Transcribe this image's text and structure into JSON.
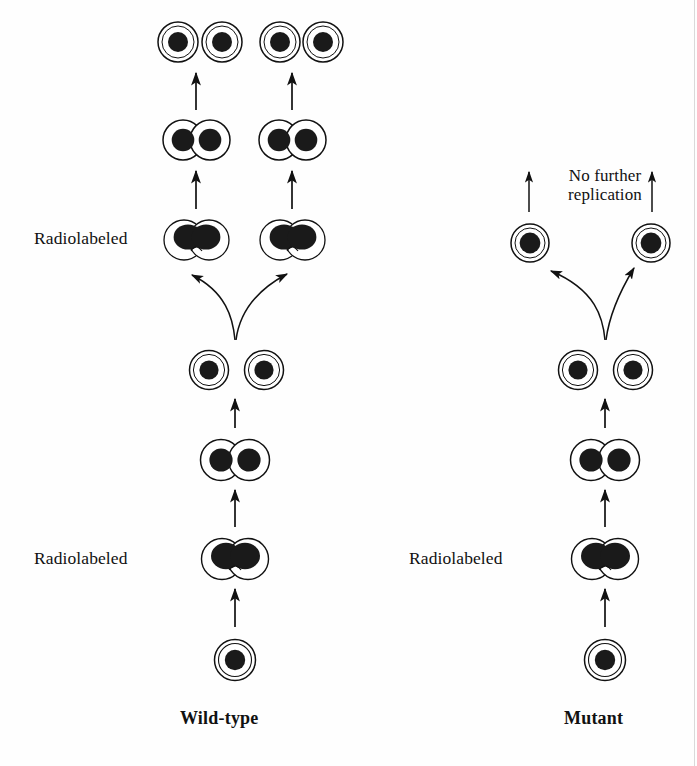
{
  "figure": {
    "background_color": "#ffffff",
    "ink_color": "#111111",
    "nucleus_color": "#1a1a1a",
    "width": 697,
    "height": 766
  },
  "labels": {
    "wild_type": "Wild-type",
    "mutant": "Mutant",
    "radiolabeled_left_bottom": "Radiolabeled",
    "radiolabeled_left_upper": "Radiolabeled",
    "radiolabeled_right_bottom": "Radiolabeled",
    "no_further_replication": "No further replication"
  },
  "columns": [
    {
      "id": "wild-type",
      "label": "Wild-type",
      "center_x": 235,
      "label_y": 719,
      "generations": [
        {
          "id": "wt-gen0",
          "row": 0,
          "y": 660,
          "cell_type": "single",
          "radiolabeled": false,
          "cells": [
            {
              "x": 235,
              "nuclei": 1
            }
          ],
          "description": "Single unlabeled founder cell"
        },
        {
          "id": "wt-gen1",
          "row": 1,
          "y": 559,
          "cell_type": "dividing-fused",
          "radiolabeled": true,
          "label": "Radiolabeled",
          "cells": [
            {
              "x": 235,
              "nuclei": 2
            }
          ],
          "description": "Radiolabeled dividing cell with fused dark nucleoids"
        },
        {
          "id": "wt-gen2",
          "row": 2,
          "y": 460,
          "cell_type": "dividing-pair",
          "radiolabeled": false,
          "cells": [
            {
              "x": 235,
              "nuclei": 2
            }
          ],
          "description": "Dividing cell, two separated nuclei"
        },
        {
          "id": "wt-gen3",
          "row": 3,
          "y": 370,
          "cell_type": "two-singles",
          "radiolabeled": false,
          "cells": [
            {
              "x": 209,
              "nuclei": 1
            },
            {
              "x": 264,
              "nuclei": 1
            }
          ],
          "description": "Two separate daughter cells"
        },
        {
          "id": "wt-gen4",
          "row": 4,
          "y": 240,
          "cell_type": "dividing-fused",
          "radiolabeled": true,
          "label": "Radiolabeled",
          "cells": [
            {
              "x": 196,
              "nuclei": 2
            },
            {
              "x": 292,
              "nuclei": 2
            }
          ],
          "description": "Two radiolabeled dividing cells produced by branching"
        },
        {
          "id": "wt-gen5",
          "row": 5,
          "y": 140,
          "cell_type": "dividing-pair",
          "radiolabeled": false,
          "cells": [
            {
              "x": 196,
              "nuclei": 2
            },
            {
              "x": 292,
              "nuclei": 2
            }
          ],
          "description": "Two dividing cells with separated nuclei"
        },
        {
          "id": "wt-gen6",
          "row": 6,
          "y": 42,
          "cell_type": "singles-row",
          "radiolabeled": false,
          "cells": [
            {
              "x": 178,
              "nuclei": 1
            },
            {
              "x": 222,
              "nuclei": 1
            },
            {
              "x": 280,
              "nuclei": 1
            },
            {
              "x": 323,
              "nuclei": 1
            }
          ],
          "description": "Four separate daughter cells"
        }
      ],
      "straight_arrows": [
        {
          "x": 235,
          "y_from": 627,
          "y_to": 588
        },
        {
          "x": 235,
          "y_from": 527,
          "y_to": 489
        },
        {
          "x": 235,
          "y_from": 428,
          "y_to": 398
        },
        {
          "x": 196,
          "y_from": 209,
          "y_to": 170
        },
        {
          "x": 292,
          "y_from": 209,
          "y_to": 170
        },
        {
          "x": 196,
          "y_from": 110,
          "y_to": 72
        },
        {
          "x": 292,
          "y_from": 110,
          "y_to": 72
        }
      ],
      "branch": {
        "stem_x": 235,
        "stem_y": 338,
        "left_target_x": 186,
        "right_target_x": 292,
        "target_y": 272
      }
    },
    {
      "id": "mutant",
      "label": "Mutant",
      "center_x": 605,
      "label_y": 719,
      "generations": [
        {
          "id": "mut-gen0",
          "row": 0,
          "y": 660,
          "cell_type": "single",
          "radiolabeled": false,
          "cells": [
            {
              "x": 605,
              "nuclei": 1
            }
          ],
          "description": "Single unlabeled founder cell"
        },
        {
          "id": "mut-gen1",
          "row": 1,
          "y": 559,
          "cell_type": "dividing-fused",
          "radiolabeled": true,
          "label": "Radiolabeled",
          "cells": [
            {
              "x": 605,
              "nuclei": 2
            }
          ],
          "description": "Radiolabeled dividing cell with fused dark nucleoids"
        },
        {
          "id": "mut-gen2",
          "row": 2,
          "y": 460,
          "cell_type": "dividing-pair",
          "radiolabeled": false,
          "cells": [
            {
              "x": 605,
              "nuclei": 2
            }
          ],
          "description": "Dividing cell, two separated nuclei"
        },
        {
          "id": "mut-gen3",
          "row": 3,
          "y": 370,
          "cell_type": "two-singles",
          "radiolabeled": false,
          "cells": [
            {
              "x": 578,
              "nuclei": 1
            },
            {
              "x": 633,
              "nuclei": 1
            }
          ],
          "description": "Two separate daughter cells"
        },
        {
          "id": "mut-gen4",
          "row": 4,
          "y": 243,
          "cell_type": "singles-branched",
          "radiolabeled": false,
          "cells": [
            {
              "x": 530,
              "nuclei": 1
            },
            {
              "x": 651,
              "nuclei": 1
            }
          ],
          "description": "Two single daughter cells; replication stops here"
        }
      ],
      "straight_arrows": [
        {
          "x": 605,
          "y_from": 627,
          "y_to": 588
        },
        {
          "x": 605,
          "y_from": 527,
          "y_to": 489
        },
        {
          "x": 605,
          "y_from": 428,
          "y_to": 398
        }
      ],
      "branch": {
        "stem_x": 605,
        "stem_y": 338,
        "left_target_x": 548,
        "right_target_x": 637,
        "target_y": 268
      },
      "terminal_arrows": [
        {
          "x": 529,
          "y_from": 212,
          "y_to": 170
        },
        {
          "x": 652,
          "y_from": 212,
          "y_to": 170
        }
      ],
      "annotation": {
        "text": "No further replication",
        "x": 545,
        "y": 168
      }
    }
  ],
  "label_positions": {
    "radiolabeled_left_bottom": {
      "x": 34,
      "y": 551
    },
    "radiolabeled_left_upper": {
      "x": 34,
      "y": 228
    },
    "radiolabeled_right_bottom": {
      "x": 410,
      "y": 551
    },
    "wild_type": {
      "x": 182,
      "y": 711
    },
    "mutant": {
      "x": 565,
      "y": 711
    }
  }
}
